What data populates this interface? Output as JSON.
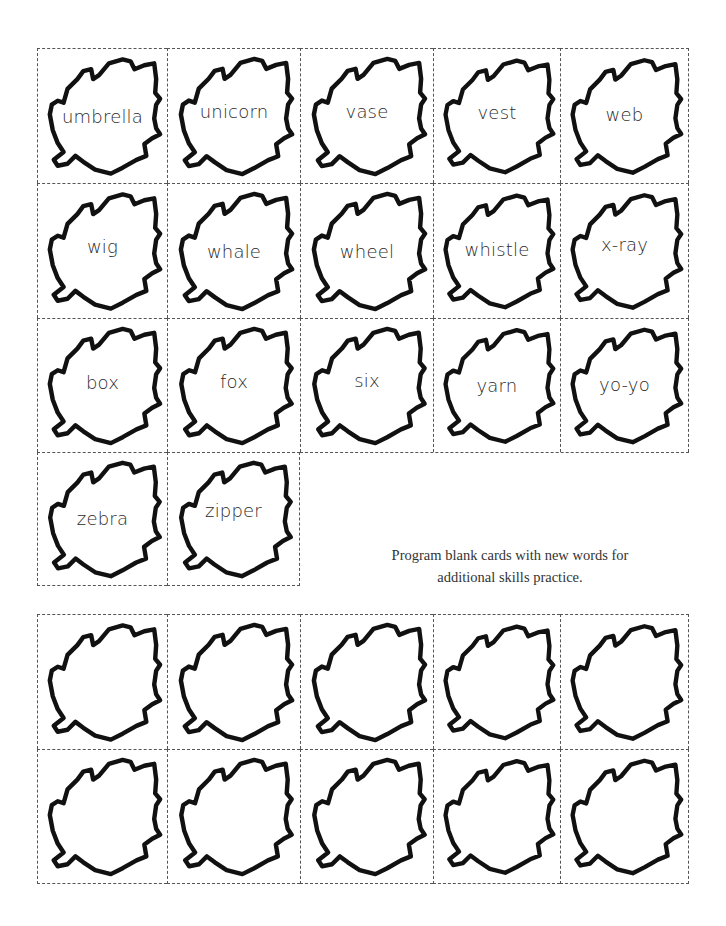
{
  "worksheet": {
    "word_cards": [
      {
        "word": "umbrella",
        "text_top": 59
      },
      {
        "word": "unicorn",
        "text_top": 54
      },
      {
        "word": "vase",
        "text_top": 54
      },
      {
        "word": "vest",
        "text_top": 55
      },
      {
        "word": "web",
        "text_top": 57
      },
      {
        "word": "wig",
        "text_top": 54
      },
      {
        "word": "whale",
        "text_top": 59
      },
      {
        "word": "wheel",
        "text_top": 59
      },
      {
        "word": "whistle",
        "text_top": 57
      },
      {
        "word": "x-ray",
        "text_top": 52
      },
      {
        "word": "box",
        "text_top": 55
      },
      {
        "word": "fox",
        "text_top": 54
      },
      {
        "word": "six",
        "text_top": 53
      },
      {
        "word": "yarn",
        "text_top": 58
      },
      {
        "word": "yo-yo",
        "text_top": 57
      },
      {
        "word": "zebra",
        "text_top": 57
      },
      {
        "word": "zipper",
        "text_top": 49
      }
    ],
    "instructions": {
      "line1": "Program blank cards with new words for",
      "line2": "additional skills practice."
    },
    "blank_cards_count": 10,
    "colors": {
      "leaf_outline": "#111111",
      "cut_line": "#555555",
      "text": "#2a2a2a"
    }
  }
}
